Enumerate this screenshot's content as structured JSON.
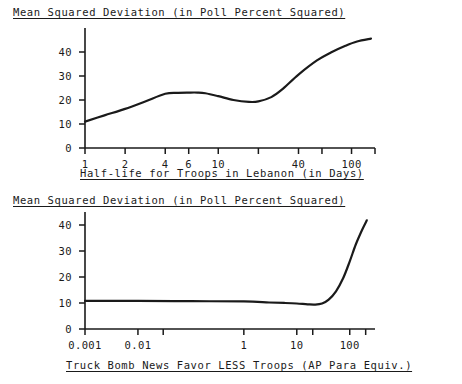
{
  "page": {
    "background": "#ffffff",
    "ink": "#1a1a1a",
    "width": 462,
    "height": 384
  },
  "chart_data": [
    {
      "id": "top",
      "type": "line",
      "title": "Mean Squared Deviation (in Poll Percent Squared)",
      "xlabel": "Half-life for Troops in Lebanon (in Days)",
      "ylabel": "",
      "xscale": "log",
      "yscale": "linear",
      "xlim": [
        1,
        150
      ],
      "ylim": [
        0,
        50
      ],
      "grid": false,
      "legend": null,
      "xticklabels": [
        "1",
        "2",
        "4",
        "6",
        "10",
        "40",
        "100"
      ],
      "xtickvalues": [
        1,
        2,
        4,
        6,
        10,
        40,
        100
      ],
      "xminorticks": [
        1,
        2,
        4,
        6,
        10,
        20,
        40,
        60,
        100,
        150
      ],
      "yticklabels": [
        "0",
        "10",
        "20",
        "30",
        "40"
      ],
      "ytickvalues": [
        0,
        10,
        20,
        30,
        40
      ],
      "x": [
        1,
        1.4,
        2,
        2.8,
        4,
        5,
        6,
        7,
        8,
        10,
        13,
        17,
        20,
        25,
        30,
        40,
        55,
        70,
        90,
        110,
        140
      ],
      "y": [
        11.0,
        13.6,
        16.3,
        19.3,
        22.6,
        23.0,
        23.1,
        23.1,
        22.8,
        21.6,
        20.0,
        19.2,
        19.4,
        21.2,
        24.3,
        30.6,
        36.5,
        39.8,
        42.6,
        44.4,
        45.6
      ]
    },
    {
      "id": "bottom",
      "type": "line",
      "title": "Mean Squared Deviation (in Poll Percent Squared)",
      "xlabel": "Truck Bomb News Favor LESS Troops (AP Para Equiv.)",
      "ylabel": "",
      "xscale": "log",
      "yscale": "linear",
      "xlim": [
        0.001,
        300
      ],
      "ylim": [
        0,
        45
      ],
      "grid": false,
      "legend": null,
      "xticklabels": [
        "0.001",
        "0.01",
        "1",
        "10",
        "100"
      ],
      "xtickvalues": [
        0.001,
        0.01,
        1,
        10,
        100
      ],
      "xminorticks": [
        0.001,
        0.01,
        0.03,
        1,
        10,
        20,
        100,
        200
      ],
      "yticklabels": [
        "0",
        "10",
        "20",
        "30",
        "40"
      ],
      "ytickvalues": [
        0,
        10,
        20,
        30,
        40
      ],
      "x": [
        0.001,
        0.01,
        0.1,
        1,
        3,
        6,
        10,
        16,
        22,
        30,
        40,
        55,
        75,
        100,
        130,
        170,
        210
      ],
      "y": [
        10.8,
        10.8,
        10.7,
        10.6,
        10.2,
        10.0,
        9.8,
        9.5,
        9.4,
        9.8,
        11.3,
        14.5,
        19.5,
        26.0,
        32.5,
        38.0,
        41.8
      ]
    }
  ]
}
